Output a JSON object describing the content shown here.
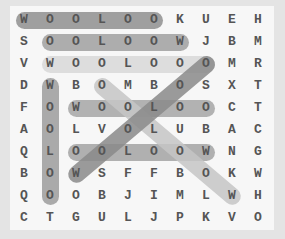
{
  "puzzle": {
    "grid": [
      [
        "W",
        "O",
        "O",
        "L",
        "O",
        "O",
        "K",
        "U",
        "E",
        "H"
      ],
      [
        "S",
        "O",
        "O",
        "L",
        "O",
        "O",
        "W",
        "J",
        "B",
        "M"
      ],
      [
        "V",
        "W",
        "O",
        "O",
        "L",
        "O",
        "O",
        "O",
        "M",
        "R"
      ],
      [
        "D",
        "W",
        "B",
        "O",
        "M",
        "B",
        "O",
        "S",
        "X",
        "T"
      ],
      [
        "F",
        "O",
        "W",
        "O",
        "O",
        "L",
        "O",
        "O",
        "C",
        "T"
      ],
      [
        "A",
        "O",
        "L",
        "V",
        "O",
        "L",
        "U",
        "B",
        "A",
        "C"
      ],
      [
        "Q",
        "L",
        "O",
        "O",
        "L",
        "O",
        "O",
        "W",
        "N",
        "G"
      ],
      [
        "B",
        "O",
        "W",
        "S",
        "F",
        "F",
        "B",
        "O",
        "K",
        "W"
      ],
      [
        "Q",
        "O",
        "O",
        "B",
        "J",
        "I",
        "M",
        "L",
        "W",
        "H"
      ],
      [
        "C",
        "T",
        "G",
        "U",
        "L",
        "J",
        "P",
        "K",
        "V",
        "O"
      ]
    ],
    "highlights": [
      {
        "word": "WOOLOO",
        "start": [
          0,
          0
        ],
        "end": [
          0,
          5
        ],
        "color": "#8f8f8f"
      },
      {
        "word": "OOLOOW",
        "start": [
          1,
          1
        ],
        "end": [
          1,
          6
        ],
        "color": "#a0a0a0"
      },
      {
        "word": "WOOLOOO",
        "start": [
          2,
          1
        ],
        "end": [
          2,
          7
        ],
        "color": "#d8d8d8"
      },
      {
        "word": "WOOLOO",
        "start": [
          3,
          1
        ],
        "end": [
          8,
          1
        ],
        "color": "#9c9c9c"
      },
      {
        "word": "WOOLOO",
        "start": [
          4,
          2
        ],
        "end": [
          4,
          7
        ],
        "color": "#a6a6a6"
      },
      {
        "word": "OOLOOW",
        "start": [
          6,
          2
        ],
        "end": [
          6,
          7
        ],
        "color": "#a3a3a3"
      },
      {
        "word": "OOLOOW",
        "start": [
          3,
          3
        ],
        "end": [
          8,
          8
        ],
        "color": "#c6c6c6"
      },
      {
        "word": "OOLOOW",
        "start": [
          2,
          7
        ],
        "end": [
          7,
          2
        ],
        "color": "#8a8a8a"
      }
    ]
  }
}
